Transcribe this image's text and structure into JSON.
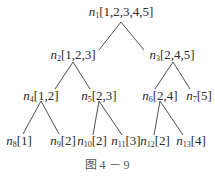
{
  "diagram": {
    "type": "binary-tree",
    "caption": "图 4 － 9",
    "line_color": "#3a3a3a",
    "text_color": "#2a2a2a",
    "nodes": [
      {
        "id": "n1",
        "prefix": "n",
        "index": "1",
        "set": "[1,2,3,4,5]",
        "x": 121,
        "y": 5
      },
      {
        "id": "n2",
        "prefix": "n",
        "index": "2",
        "set": "[1,2,3]",
        "x": 73,
        "y": 48
      },
      {
        "id": "n3",
        "prefix": "n",
        "index": "3",
        "set": "[2,4,5]",
        "x": 172,
        "y": 48
      },
      {
        "id": "n4",
        "prefix": "n",
        "index": "4",
        "set": "[1,2]",
        "x": 41,
        "y": 89
      },
      {
        "id": "n5",
        "prefix": "n",
        "index": "5",
        "set": "[2,3]",
        "x": 99,
        "y": 89
      },
      {
        "id": "n6",
        "prefix": "n",
        "index": "6",
        "set": "[2,4]",
        "x": 160,
        "y": 89
      },
      {
        "id": "n7",
        "prefix": "n",
        "index": "7",
        "set": "[5]",
        "x": 199,
        "y": 89
      },
      {
        "id": "n8",
        "prefix": "n",
        "index": "8",
        "set": "[1]",
        "x": 19,
        "y": 134
      },
      {
        "id": "n9",
        "prefix": "n",
        "index": "9",
        "set": "[2]",
        "x": 63,
        "y": 134
      },
      {
        "id": "n10",
        "prefix": "n",
        "index": "10",
        "set": "[2]",
        "x": 92,
        "y": 134
      },
      {
        "id": "n11",
        "prefix": "n",
        "index": "11",
        "set": "[3]",
        "x": 126,
        "y": 134
      },
      {
        "id": "n12",
        "prefix": "n",
        "index": "12",
        "set": "[2]",
        "x": 155,
        "y": 134
      },
      {
        "id": "n13",
        "prefix": "n",
        "index": "13",
        "set": "[4]",
        "x": 191,
        "y": 134
      }
    ],
    "edges": [
      {
        "from": "n1",
        "to": "n2",
        "x1": 121,
        "y1": 22,
        "x2": 99,
        "y2": 50
      },
      {
        "from": "n1",
        "to": "n3",
        "x1": 121,
        "y1": 22,
        "x2": 144,
        "y2": 50
      },
      {
        "from": "n2",
        "to": "n4",
        "x1": 73,
        "y1": 62,
        "x2": 55,
        "y2": 89
      },
      {
        "from": "n2",
        "to": "n5",
        "x1": 73,
        "y1": 62,
        "x2": 90,
        "y2": 89
      },
      {
        "from": "n3",
        "to": "n6",
        "x1": 173,
        "y1": 62,
        "x2": 155,
        "y2": 89
      },
      {
        "from": "n3",
        "to": "n7",
        "x1": 173,
        "y1": 62,
        "x2": 190,
        "y2": 89
      },
      {
        "from": "n4",
        "to": "n8",
        "x1": 41,
        "y1": 101,
        "x2": 23,
        "y2": 134
      },
      {
        "from": "n4",
        "to": "n9",
        "x1": 41,
        "y1": 101,
        "x2": 59,
        "y2": 134
      },
      {
        "from": "n5",
        "to": "n10",
        "x1": 99,
        "y1": 101,
        "x2": 93,
        "y2": 135
      },
      {
        "from": "n5",
        "to": "n11",
        "x1": 99,
        "y1": 101,
        "x2": 122,
        "y2": 135
      },
      {
        "from": "n6",
        "to": "n12",
        "x1": 160,
        "y1": 101,
        "x2": 154,
        "y2": 135
      },
      {
        "from": "n6",
        "to": "n13",
        "x1": 160,
        "y1": 101,
        "x2": 183,
        "y2": 135
      }
    ]
  }
}
